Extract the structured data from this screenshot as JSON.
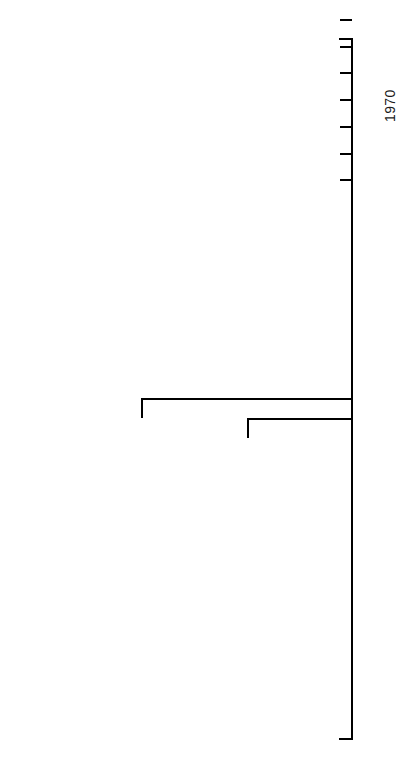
{
  "figure": {
    "type": "timeline",
    "orientation": "vertical",
    "axis": {
      "label": "",
      "min_year": 1947,
      "max_year": 1973,
      "tick_interval_years": 1,
      "labeled_years": [
        "1950",
        "1955",
        "1960",
        "1965",
        "1970"
      ]
    }
  },
  "chart_data": {
    "type": "timeline",
    "title": "",
    "xlabel": "",
    "ylabel": "",
    "ylim": [
      1947,
      1973
    ],
    "grid": false,
    "legend": null,
    "axis_ticks": [
      1947,
      1948,
      1949,
      1950,
      1951,
      1952,
      1953,
      1954,
      1955,
      1956,
      1957,
      1958,
      1959,
      1960,
      1961,
      1962,
      1963,
      1964,
      1965,
      1966,
      1967,
      1968,
      1969,
      1970,
      1971,
      1972,
      1973
    ],
    "axis_tick_labels": [
      "1950",
      "1955",
      "1960",
      "1965",
      "1970"
    ],
    "categories": [
      "DOD Requests Invulnerable Global Communications",
      "Air Force Plans Orbiting Band of Needles",
      "Astronomers Concerned",
      "NAS Conducts Study",
      "Air Force Announces Test Plans",
      "International Astronomers Union Protests",
      "Test Fails to Orbit",
      "2nd Test Successful Protests Follow",
      "Project Halted",
      "Needles Belt Dissipating"
    ],
    "values": [
      1958.0,
      1958.6,
      1959.4,
      1960.2,
      1961.9,
      1962.3,
      1962.7,
      1963.9,
      1964.9,
      1966.1
    ]
  },
  "events": [
    {
      "id": "dod-requests",
      "lines": [
        "DOD Requests",
        "Invulnerable",
        "Global",
        "Communications"
      ],
      "year": 1958.0
    },
    {
      "id": "air-force-plans",
      "lines": [
        "Air Force",
        "Plans",
        "Orbiting",
        "Band of",
        "Needles"
      ],
      "year": 1958.6
    },
    {
      "id": "astronomers-concerned",
      "lines": [
        "Astronomers",
        "Concerned"
      ],
      "year": 1959.4
    },
    {
      "id": "nas-study",
      "lines": [
        "NAS",
        "Conducts",
        "Study"
      ],
      "year": 1960.2
    },
    {
      "id": "air-force-announces",
      "lines": [
        "Air Force",
        "Announces",
        "Test Plans"
      ],
      "year": 1961.9
    },
    {
      "id": "iau-protests",
      "lines": [
        "International",
        "Astronomers",
        "Union Protests"
      ],
      "year": 1962.3
    },
    {
      "id": "test-fails",
      "lines": [
        "Test",
        "Fails",
        "to",
        "Orbit"
      ],
      "year": 1962.7
    },
    {
      "id": "second-test",
      "lines": [
        "2nd Test",
        "Successful",
        "Protests",
        "Follow"
      ],
      "year": 1963.9
    },
    {
      "id": "project-halted",
      "lines": [
        "Project",
        "Halted"
      ],
      "year": 1964.9
    },
    {
      "id": "needles-dissipating",
      "lines": [
        "Needles",
        "Belt",
        "Dissipating"
      ],
      "year": 1966.1
    }
  ],
  "years": {
    "y1950": "1950",
    "y1955": "1955",
    "y1960": "1960",
    "y1965": "1965",
    "y1970": "1970"
  }
}
